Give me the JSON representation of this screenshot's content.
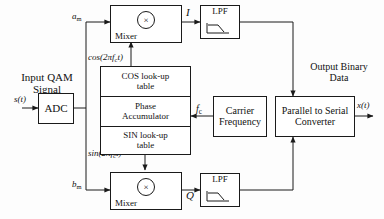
{
  "diagram": {
    "type": "block-diagram",
    "line_color": "#1a1a1a",
    "background": "#fdfdfd"
  },
  "labels": {
    "input_caption_line1": "Input QAM",
    "input_caption_line2": "Signal",
    "input_signal": "s(t)",
    "a_branch": "a",
    "a_branch_sub": "m",
    "b_branch": "b",
    "b_branch_sub": "m",
    "cos_carrier": "cos(2πf",
    "cos_carrier_sub": "c",
    "cos_carrier_tail": "t)",
    "sin_carrier": "sin(2πf",
    "sin_carrier_sub": "c",
    "sin_carrier_tail": "t)",
    "i_branch": "I",
    "q_branch": "Q",
    "fc_label": "f",
    "fc_label_sub": "c",
    "output_caption_line1": "Output Binary",
    "output_caption_line2": "Data",
    "output_signal": "x(t)"
  },
  "blocks": {
    "adc": {
      "label": "ADC"
    },
    "mixer_top": {
      "label": "Mixer",
      "operator": "×"
    },
    "mixer_bottom": {
      "label": "Mixer",
      "operator": "×"
    },
    "lpf_top": {
      "label": "LPF"
    },
    "lpf_bottom": {
      "label": "LPF"
    },
    "cos_table": {
      "line1": "COS look-up",
      "line2": "table"
    },
    "phase_accumulator": {
      "line1": "Phase",
      "line2": "Accumulator"
    },
    "sin_table": {
      "line1": "SIN look-up",
      "line2": "table"
    },
    "carrier_frequency": {
      "line1": "Carrier",
      "line2": "Frequency"
    },
    "parallel_to_serial": {
      "line1": "Parallel to Serial",
      "line2": "Converter"
    }
  }
}
